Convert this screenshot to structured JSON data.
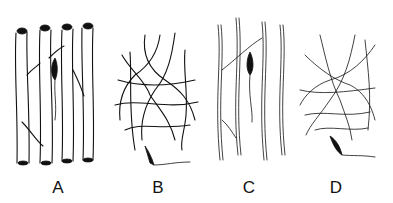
{
  "figure": {
    "panels": [
      {
        "id": "A",
        "label": "A",
        "description": "parallel tubular fibers with a dark cell body"
      },
      {
        "id": "B",
        "label": "B",
        "description": "interwoven branching network of fibers"
      },
      {
        "id": "C",
        "label": "C",
        "description": "parallel thin wavy fiber bundles with a dark cell body"
      },
      {
        "id": "D",
        "label": "D",
        "description": "irregular meshwork of thin fibers with a dark cell body"
      }
    ]
  }
}
